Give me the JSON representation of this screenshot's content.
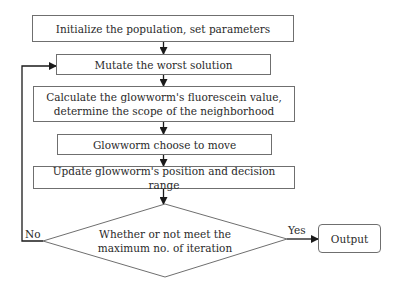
{
  "flowchart": {
    "steps": [
      {
        "id": "init",
        "label": "Initialize the population, set parameters"
      },
      {
        "id": "mutate",
        "label": "Mutate the worst solution"
      },
      {
        "id": "calculate",
        "label": "Calculate the glowworm's fluorescein value, determine the scope of the neighborhood"
      },
      {
        "id": "move",
        "label": "Glowworm choose to move"
      },
      {
        "id": "update",
        "label": "Update glowworm's position and decision range"
      }
    ],
    "decision": {
      "label": "Whether or not meet the maximum no. of iteration"
    },
    "branches": {
      "no": "No",
      "yes": "Yes"
    },
    "output": {
      "label": "Output"
    }
  },
  "colors": {
    "stroke": "#6f6f6f",
    "arrow": "#1a1a1a",
    "text": "#2a2a2a"
  }
}
